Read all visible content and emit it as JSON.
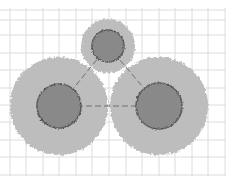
{
  "diagram": {
    "background": "#ffffff",
    "grid": {
      "color": "#dcdcdc",
      "x_lines": [
        10,
        26,
        43,
        59,
        76,
        92,
        109,
        126,
        142,
        159,
        175,
        192,
        208,
        225
      ],
      "y_lines": [
        10,
        20,
        35,
        53,
        70,
        88,
        105,
        122,
        140,
        157,
        175
      ],
      "x_extent": [
        0,
        226
      ],
      "y_extent": [
        8,
        176
      ]
    },
    "particles": [
      {
        "id": "top",
        "cx": 108,
        "cy": 46,
        "halo_r": 27,
        "core_r": 16
      },
      {
        "id": "left",
        "cx": 59,
        "cy": 106,
        "halo_r": 49,
        "core_r": 22
      },
      {
        "id": "right",
        "cx": 159,
        "cy": 106,
        "halo_r": 49,
        "core_r": 23
      }
    ],
    "colors": {
      "halo": "#bdbdbd",
      "core": "#8a8a8a",
      "core_edge": "#4a4a4a",
      "bond": "#6e6e6e"
    },
    "bonds": [
      {
        "from": "left",
        "to": "right",
        "style": "dashed"
      },
      {
        "from": "left",
        "to": "top",
        "style": "dashed"
      },
      {
        "from": "right",
        "to": "top",
        "style": "dashed"
      }
    ]
  }
}
